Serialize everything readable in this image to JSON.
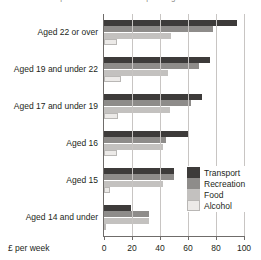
{
  "chart": {
    "title": "Components of Consumer Spending",
    "xlabel": "£ per week"
  },
  "legend": {
    "position": "inside-right",
    "items": [
      {
        "label": "Transport",
        "color": "#3d3b3a"
      },
      {
        "label": "Recreation",
        "color": "#8e8c8a"
      },
      {
        "label": "Food",
        "color": "#c3c1bf"
      },
      {
        "label": "Alcohol",
        "color": "#eceae8"
      }
    ]
  },
  "chart_data": {
    "type": "bar",
    "orientation": "horizontal",
    "title": "Components of Consumer Spending",
    "xlabel": "£ per week",
    "ylabel": "",
    "xlim": [
      0,
      100
    ],
    "xticks": [
      0,
      20,
      40,
      60,
      80,
      100
    ],
    "grid": true,
    "categories": [
      "Aged 22 or over",
      "Aged 19 and under 22",
      "Aged 17 and under 19",
      "Aged 16",
      "Aged 15",
      "Aged 14 and under"
    ],
    "series": [
      {
        "name": "Transport",
        "color": "#3d3b3a",
        "values": [
          95,
          76,
          70,
          60,
          50,
          19
        ]
      },
      {
        "name": "Recreation",
        "color": "#8e8c8a",
        "values": [
          78,
          68,
          62,
          44,
          50,
          32
        ]
      },
      {
        "name": "Food",
        "color": "#c3c1bf",
        "values": [
          48,
          46,
          47,
          42,
          42,
          32
        ]
      },
      {
        "name": "Alcohol",
        "color": "#eceae8",
        "values": [
          9,
          12,
          10,
          9,
          4,
          1
        ]
      }
    ]
  }
}
